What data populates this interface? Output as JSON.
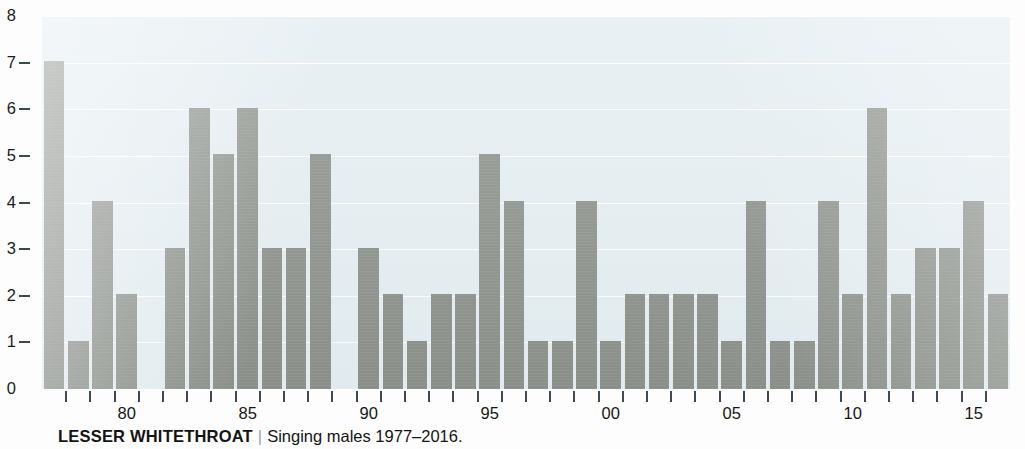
{
  "caption": {
    "species": "LESSER WHITETHROAT",
    "divider": "|",
    "subtitle": "Singing males 1977–2016."
  },
  "colors": {
    "bar": "#8b908a",
    "plot_background": "#e4edf1",
    "gridline": "#ffffff",
    "axis_text": "#161616",
    "tick": "#3d4a50",
    "page_background": "#fdfdfd"
  },
  "chart_data": {
    "type": "bar",
    "title": "LESSER WHITETHROAT",
    "subtitle": "Singing males 1977–2016.",
    "xlabel": "",
    "ylabel": "",
    "ylim": [
      0,
      8
    ],
    "ytick_labels": [
      "0",
      "1",
      "2",
      "3",
      "4",
      "5",
      "6",
      "7",
      "8"
    ],
    "yticks": [
      0,
      1,
      2,
      3,
      4,
      5,
      6,
      7,
      8
    ],
    "grid": true,
    "legend": false,
    "xtick_labels": [
      "80",
      "85",
      "90",
      "95",
      "00",
      "05",
      "10",
      "15"
    ],
    "xticks_years": [
      1980,
      1985,
      1990,
      1995,
      2000,
      2005,
      2010,
      2015
    ],
    "categories": [
      "1977",
      "1978",
      "1979",
      "1980",
      "1981",
      "1982",
      "1983",
      "1984",
      "1985",
      "1986",
      "1987",
      "1988",
      "1989",
      "1990",
      "1991",
      "1992",
      "1993",
      "1994",
      "1995",
      "1996",
      "1997",
      "1998",
      "1999",
      "2000",
      "2001",
      "2002",
      "2003",
      "2004",
      "2005",
      "2006",
      "2007",
      "2008",
      "2009",
      "2010",
      "2011",
      "2012",
      "2013",
      "2014",
      "2015",
      "2016"
    ],
    "values": [
      7,
      1,
      4,
      2,
      0,
      3,
      6,
      5,
      6,
      3,
      3,
      5,
      0,
      3,
      2,
      1,
      2,
      2,
      5,
      4,
      1,
      1,
      4,
      1,
      2,
      2,
      2,
      2,
      1,
      4,
      1,
      1,
      4,
      2,
      6,
      2,
      3,
      3,
      4,
      2
    ]
  }
}
